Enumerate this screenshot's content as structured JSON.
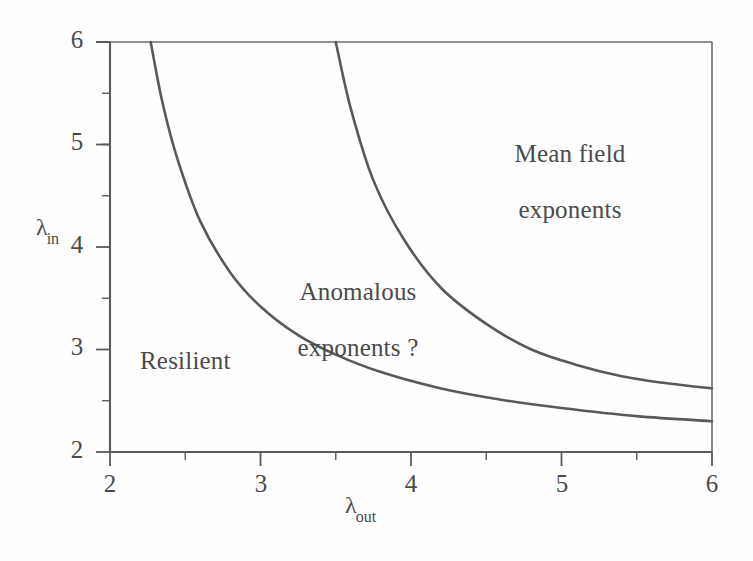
{
  "chart_data": {
    "type": "line",
    "title": "",
    "subtitle": "",
    "xlabel": "λ_out",
    "ylabel": "λ_in",
    "xlim": [
      2,
      6
    ],
    "ylim": [
      2,
      6
    ],
    "grid": false,
    "legend_position": "none",
    "x_major_ticks": [
      2,
      3,
      4,
      5,
      6
    ],
    "y_major_ticks": [
      2,
      3,
      4,
      5,
      6
    ],
    "x_minor_ticks": [
      2.5,
      3.5,
      4.5,
      5.5
    ],
    "y_minor_ticks": [
      2.5,
      3.5,
      4.5,
      5.5
    ],
    "x_tick_labels": [
      "2",
      "3",
      "4",
      "5",
      "6"
    ],
    "y_tick_labels": [
      "2",
      "3",
      "4",
      "5",
      "6"
    ],
    "series": [
      {
        "name": "lower-boundary",
        "comment": "Resilient / Anomalous exponents boundary",
        "x": [
          2.27,
          2.35,
          2.45,
          2.6,
          2.8,
          3.0,
          3.25,
          3.5,
          3.8,
          4.2,
          4.6,
          5.0,
          5.5,
          6.0
        ],
        "y": [
          6.0,
          5.4,
          4.85,
          4.25,
          3.75,
          3.42,
          3.14,
          2.95,
          2.78,
          2.62,
          2.51,
          2.43,
          2.35,
          2.3
        ]
      },
      {
        "name": "upper-boundary",
        "comment": "Anomalous exponents / Mean field exponents boundary",
        "x": [
          3.5,
          3.6,
          3.75,
          3.95,
          4.2,
          4.5,
          4.8,
          5.1,
          5.4,
          5.7,
          6.0
        ],
        "y": [
          6.0,
          5.35,
          4.65,
          4.08,
          3.6,
          3.25,
          3.0,
          2.85,
          2.74,
          2.67,
          2.62
        ]
      }
    ],
    "annotations": [
      {
        "name": "mean-field",
        "text": "Mean field\nexponents",
        "x": 5.05,
        "y": 5.05
      },
      {
        "name": "anomalous",
        "text": "Anomalous\nexponents ?",
        "x": 3.35,
        "y": 3.6
      },
      {
        "name": "resilient",
        "text": "Resilient",
        "x": 2.55,
        "y": 2.75
      }
    ],
    "colors": {
      "curve": "#595959",
      "axis": "#5a5a5a",
      "text": "#4a4a4a",
      "background": "#ffffff"
    }
  },
  "axes": {
    "x": {
      "title_base": "λ",
      "title_sub": "out",
      "labels": [
        "2",
        "3",
        "4",
        "5",
        "6"
      ]
    },
    "y": {
      "title_base": "λ",
      "title_sub": "in",
      "labels": [
        "6",
        "5",
        "4",
        "3",
        "2"
      ]
    }
  },
  "regions": {
    "mean_field_line1": "Mean field",
    "mean_field_line2": "exponents",
    "anomalous_line1": "Anomalous",
    "anomalous_line2": "exponents ?",
    "resilient": "Resilient"
  }
}
